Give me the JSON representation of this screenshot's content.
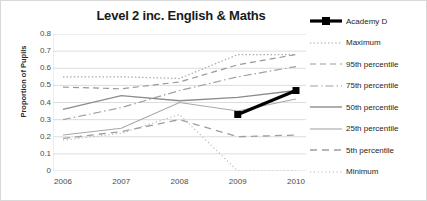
{
  "chart_data": {
    "type": "line",
    "title": "Level 2 inc. English & Maths",
    "xlabel": "",
    "ylabel": "Proportion of Pupils",
    "categories": [
      "2006",
      "2007",
      "2008",
      "2009",
      "2010"
    ],
    "x": [
      2006,
      2007,
      2008,
      2009,
      2010
    ],
    "ylim": [
      0,
      0.8
    ],
    "y_ticks": [
      "0",
      "0.1",
      "0.2",
      "0.3",
      "0.4",
      "0.5",
      "0.6",
      "0.7",
      "0.8"
    ],
    "y_tick_values": [
      0,
      0.1,
      0.2,
      0.3,
      0.4,
      0.5,
      0.6,
      0.7,
      0.8
    ],
    "grid": true,
    "legend_position": "right",
    "series": [
      {
        "name": "Academy D",
        "style": "solid-thick-marker",
        "color": "#000000",
        "x": [
          2009,
          2010
        ],
        "values": [
          0.33,
          0.47
        ]
      },
      {
        "name": "Maximum",
        "style": "dotted",
        "color": "#a6a6a6",
        "x": [
          2006,
          2007,
          2008,
          2009,
          2010
        ],
        "values": [
          0.55,
          0.55,
          0.54,
          0.68,
          0.68
        ]
      },
      {
        "name": "95th percentile",
        "style": "dashed",
        "color": "#999999",
        "x": [
          2006,
          2007,
          2008,
          2009,
          2010
        ],
        "values": [
          0.49,
          0.48,
          0.52,
          0.62,
          0.68
        ]
      },
      {
        "name": "75th percentile",
        "style": "dash-dot",
        "color": "#a0a0a0",
        "x": [
          2006,
          2007,
          2008,
          2009,
          2010
        ],
        "values": [
          0.3,
          0.37,
          0.47,
          0.55,
          0.61
        ]
      },
      {
        "name": "50th percentile",
        "style": "solid",
        "color": "#8c8c8c",
        "x": [
          2006,
          2007,
          2008,
          2009,
          2010
        ],
        "values": [
          0.36,
          0.44,
          0.41,
          0.43,
          0.47
        ]
      },
      {
        "name": "25th  percentile",
        "style": "solid-thin",
        "color": "#a8a8a8",
        "x": [
          2006,
          2007,
          2008,
          2009,
          2010
        ],
        "values": [
          0.21,
          0.25,
          0.4,
          0.35,
          0.42
        ]
      },
      {
        "name": "5th percentile",
        "style": "long-dash",
        "color": "#9e9e9e",
        "x": [
          2006,
          2007,
          2008,
          2009,
          2010
        ],
        "values": [
          0.19,
          0.23,
          0.3,
          0.2,
          0.21
        ]
      },
      {
        "name": "Minimum",
        "style": "fine-dotted",
        "color": "#b5b5b5",
        "x": [
          2006,
          2007,
          2008,
          2009,
          2010
        ],
        "values": [
          0.18,
          0.22,
          0.33,
          0.0,
          0.0
        ]
      }
    ]
  }
}
